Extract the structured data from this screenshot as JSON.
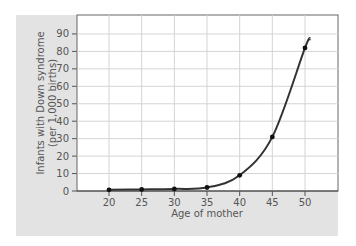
{
  "chart_data": {
    "type": "line",
    "title": "",
    "xlabel": "Age of mother",
    "ylabel_line1": "Infants with Down syndrome",
    "ylabel_line2": "(per 1,000 births)",
    "x": [
      20,
      25,
      30,
      35,
      40,
      45,
      50
    ],
    "series": [
      {
        "name": "Infants with Down syndrome (per 1,000 births)",
        "values": [
          0.7,
          0.9,
          1.2,
          2,
          9,
          31,
          82
        ]
      }
    ],
    "xticks": [
      20,
      25,
      30,
      35,
      40,
      45,
      50
    ],
    "yticks": [
      0,
      10,
      20,
      30,
      40,
      50,
      60,
      70,
      80,
      90
    ],
    "xlim": [
      15,
      55
    ],
    "ylim": [
      0,
      100
    ],
    "grid": true,
    "legend": "none",
    "colors": {
      "line": "#333333",
      "panel": "#e3e3e3",
      "plot": "#ffffff",
      "grid": "#d4d4d4",
      "axis": "#444444"
    }
  }
}
